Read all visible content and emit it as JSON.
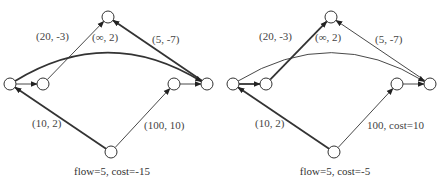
{
  "diagrams": [
    {
      "caption": "flow=5, cost=-15",
      "nodes": [
        {
          "id": "a"
        },
        {
          "id": "b"
        },
        {
          "id": "top"
        },
        {
          "id": "c"
        },
        {
          "id": "d"
        },
        {
          "id": "bottom"
        }
      ],
      "edges": [
        {
          "from": "a",
          "to": "b",
          "thick": false,
          "label": ""
        },
        {
          "from": "b",
          "to": "top",
          "thick": false,
          "label": "(20, -3)"
        },
        {
          "from": "d",
          "to": "top",
          "thick": true,
          "label": "(5, -7)"
        },
        {
          "from": "a",
          "to": "d",
          "thick": true,
          "curved": true,
          "label": "(∞, 2)"
        },
        {
          "from": "bottom",
          "to": "a",
          "thick": true,
          "label": "(10, 2)"
        },
        {
          "from": "bottom",
          "to": "c",
          "thick": false,
          "label": "(100, 10)"
        },
        {
          "from": "c",
          "to": "d",
          "thick": false,
          "label": ""
        }
      ]
    },
    {
      "caption": "flow=5, cost=-5",
      "nodes": [
        {
          "id": "a"
        },
        {
          "id": "b"
        },
        {
          "id": "top"
        },
        {
          "id": "c"
        },
        {
          "id": "d"
        },
        {
          "id": "bottom"
        }
      ],
      "edges": [
        {
          "from": "a",
          "to": "b",
          "thick": true,
          "label": ""
        },
        {
          "from": "b",
          "to": "top",
          "thick": true,
          "label": "(20, -3)"
        },
        {
          "from": "d",
          "to": "top",
          "thick": false,
          "label": "(5, -7)"
        },
        {
          "from": "a",
          "to": "d",
          "thick": false,
          "curved": true,
          "label": "(∞, 2)"
        },
        {
          "from": "bottom",
          "to": "a",
          "thick": true,
          "label": "(10, 2)"
        },
        {
          "from": "bottom",
          "to": "c",
          "thick": false,
          "label": "100, cost=10"
        },
        {
          "from": "c",
          "to": "d",
          "thick": false,
          "label": ""
        }
      ]
    }
  ]
}
